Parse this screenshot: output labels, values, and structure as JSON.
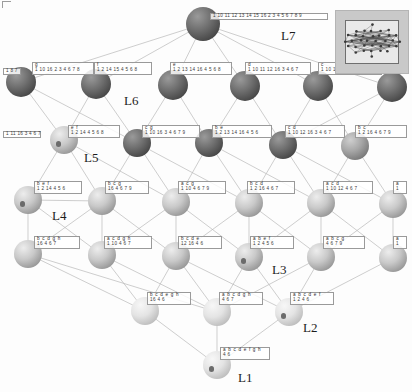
{
  "figure": {
    "kind": "concept-lattice-hasse-diagram",
    "levels": [
      "L1",
      "L2",
      "L3",
      "L4",
      "L5",
      "L6",
      "L7"
    ],
    "level_tags": [
      {
        "text": "L7",
        "x": 281,
        "y": 28
      },
      {
        "text": "L6",
        "x": 124,
        "y": 93
      },
      {
        "text": "L5",
        "x": 84,
        "y": 150
      },
      {
        "text": "L4",
        "x": 52,
        "y": 208
      },
      {
        "text": "L3",
        "x": 272,
        "y": 262
      },
      {
        "text": "L2",
        "x": 303,
        "y": 320
      },
      {
        "text": "L1",
        "x": 238,
        "y": 370
      }
    ]
  },
  "nodes": [
    {
      "id": "top",
      "level": "L7",
      "x": 203,
      "y": 24,
      "r": 17,
      "shade": "dark",
      "label": {
        "attrs": "",
        "objs": "1 10 11 12 13 14 15 16 2 3 4 5 6 7 8 9",
        "x": 210,
        "y": 13,
        "w": 118,
        "flat": true
      }
    },
    {
      "id": "l6-0",
      "level": "L6",
      "x": 21,
      "y": 82,
      "r": 15,
      "shade": "dark",
      "label": {
        "attrs": "g",
        "objs": "1 10 16 2 3 4 6 7 8",
        "x": 32,
        "y": 62,
        "w": 62,
        "flat": false
      }
    },
    {
      "id": "l6-0b",
      "level": "L6",
      "x": 21,
      "y": 82,
      "r": 0,
      "shade": "none",
      "label": {
        "attrs": "",
        "objs": "1 8 7",
        "x": 3,
        "y": 68,
        "w": 18,
        "flat": true
      }
    },
    {
      "id": "l6-1",
      "level": "L6",
      "x": 96,
      "y": 84,
      "r": 15,
      "shade": "dark",
      "label": {
        "attrs": "f",
        "objs": "1 2 14 15 4 5 6 8",
        "x": 94,
        "y": 62,
        "w": 58,
        "flat": false
      }
    },
    {
      "id": "l6-2",
      "level": "L6",
      "x": 173,
      "y": 85,
      "r": 15,
      "shade": "dark",
      "label": {
        "attrs": "e",
        "objs": "1 2 13 14 16 4 5 6 8",
        "x": 170,
        "y": 62,
        "w": 62,
        "flat": false
      }
    },
    {
      "id": "l6-3",
      "level": "L6",
      "x": 245,
      "y": 86,
      "r": 15,
      "shade": "dark",
      "label": {
        "attrs": "d",
        "objs": "1 10 11 12 16 3 4 6 7",
        "x": 245,
        "y": 62,
        "w": 66,
        "flat": false
      }
    },
    {
      "id": "l6-4",
      "level": "L6",
      "x": 318,
      "y": 86,
      "r": 15,
      "shade": "dark",
      "label": {
        "attrs": "c",
        "objs": "1 10 12 16 3 4 6 7 9",
        "x": 318,
        "y": 62,
        "w": 64,
        "flat": false
      }
    },
    {
      "id": "l6-5",
      "level": "L6",
      "x": 392,
      "y": 87,
      "r": 15,
      "shade": "dark",
      "label": {
        "attrs": "",
        "objs": "1",
        "x": 392,
        "y": 66,
        "w": 14,
        "flat": true
      }
    },
    {
      "id": "l5-0",
      "level": "L5",
      "x": 64,
      "y": 140,
      "r": 14,
      "shade": "light",
      "core": true,
      "label": {
        "attrs": "e f",
        "objs": "1 2 14 4 5 6 8",
        "x": 68,
        "y": 125,
        "w": 52,
        "flat": false
      }
    },
    {
      "id": "l5-0b",
      "level": "L5",
      "x": 0,
      "y": 0,
      "r": 0,
      "shade": "none",
      "label": {
        "attrs": "",
        "objs": "1 11 16 3 4 6 7",
        "x": 3,
        "y": 131,
        "w": 38,
        "flat": true
      }
    },
    {
      "id": "l5-1",
      "level": "L5",
      "x": 137,
      "y": 143,
      "r": 14,
      "shade": "dark",
      "label": {
        "attrs": "c g",
        "objs": "1 10 16 3 4 6 7 9",
        "x": 142,
        "y": 125,
        "w": 58,
        "flat": false
      }
    },
    {
      "id": "l5-2",
      "level": "L5",
      "x": 209,
      "y": 143,
      "r": 14,
      "shade": "dark",
      "label": {
        "attrs": "b e",
        "objs": "1 2 13 14 16 4 5 6",
        "x": 212,
        "y": 125,
        "w": 60,
        "flat": false
      }
    },
    {
      "id": "l5-3",
      "level": "L5",
      "x": 283,
      "y": 145,
      "r": 14,
      "shade": "dark",
      "label": {
        "attrs": "c d",
        "objs": "1 10 12 16 3 4 6 7",
        "x": 285,
        "y": 125,
        "w": 60,
        "flat": false
      }
    },
    {
      "id": "l5-4",
      "level": "L5",
      "x": 355,
      "y": 146,
      "r": 14,
      "shade": "mid",
      "label": {
        "attrs": "b c",
        "objs": "1 2 16 4 6 7 9",
        "x": 355,
        "y": 125,
        "w": 52,
        "flat": false
      }
    },
    {
      "id": "l4-0",
      "level": "L4",
      "x": 28,
      "y": 200,
      "r": 14,
      "shade": "light",
      "core": true,
      "label": {
        "attrs": "b e f",
        "objs": "1 2 14 4 5 6",
        "x": 34,
        "y": 181,
        "w": 48,
        "flat": false
      }
    },
    {
      "id": "l4-1",
      "level": "L4",
      "x": 102,
      "y": 201,
      "r": 14,
      "shade": "light",
      "label": {
        "attrs": "b c g",
        "objs": "16 4 6 7 9",
        "x": 105,
        "y": 181,
        "w": 44,
        "flat": false
      }
    },
    {
      "id": "l4-2",
      "level": "L4",
      "x": 176,
      "y": 202,
      "r": 14,
      "shade": "light",
      "label": {
        "attrs": "a c g",
        "objs": "1 10 4 6 7 9",
        "x": 178,
        "y": 181,
        "w": 48,
        "flat": false
      }
    },
    {
      "id": "l4-3",
      "level": "L4",
      "x": 249,
      "y": 203,
      "r": 14,
      "shade": "light",
      "label": {
        "attrs": "b c d",
        "objs": "1 2 16 4 6 7",
        "x": 247,
        "y": 181,
        "w": 48,
        "flat": false
      }
    },
    {
      "id": "l4-4",
      "level": "L4",
      "x": 321,
      "y": 203,
      "r": 14,
      "shade": "light",
      "label": {
        "attrs": "a c d",
        "objs": "1 10 12 4 6 7",
        "x": 323,
        "y": 181,
        "w": 50,
        "flat": false
      }
    },
    {
      "id": "l4-5",
      "level": "L4",
      "x": 393,
      "y": 204,
      "r": 14,
      "shade": "light",
      "label": {
        "attrs": "a",
        "objs": "1",
        "x": 393,
        "y": 181,
        "w": 14,
        "flat": false
      }
    },
    {
      "id": "l3-0",
      "level": "L3",
      "x": 28,
      "y": 254,
      "r": 14,
      "shade": "light",
      "label": {
        "attrs": "b c d g h",
        "objs": "16 4 6 7",
        "x": 34,
        "y": 236,
        "w": 46,
        "flat": false
      }
    },
    {
      "id": "l3-1",
      "level": "L3",
      "x": 102,
      "y": 255,
      "r": 14,
      "shade": "light",
      "label": {
        "attrs": "a c d g h",
        "objs": "1 10 4 6 7",
        "x": 104,
        "y": 236,
        "w": 48,
        "flat": false
      }
    },
    {
      "id": "l3-2",
      "level": "L3",
      "x": 176,
      "y": 256,
      "r": 14,
      "shade": "light",
      "label": {
        "attrs": "b c d e",
        "objs": "12 16 4 6",
        "x": 178,
        "y": 236,
        "w": 44,
        "flat": false
      }
    },
    {
      "id": "l3-3",
      "level": "L3",
      "x": 249,
      "y": 257,
      "r": 14,
      "shade": "light",
      "core": true,
      "label": {
        "attrs": "a b e f",
        "objs": "1 2 4 5 6",
        "x": 250,
        "y": 236,
        "w": 44,
        "flat": false
      }
    },
    {
      "id": "l3-4",
      "level": "L3",
      "x": 321,
      "y": 257,
      "r": 14,
      "shade": "light",
      "label": {
        "attrs": "a b c g",
        "objs": "4 6 7 9",
        "x": 323,
        "y": 236,
        "w": 42,
        "flat": false
      }
    },
    {
      "id": "l3-5",
      "level": "L3",
      "x": 393,
      "y": 258,
      "r": 14,
      "shade": "light",
      "label": {
        "attrs": "a",
        "objs": "1",
        "x": 393,
        "y": 236,
        "w": 14,
        "flat": false
      }
    },
    {
      "id": "l2-0",
      "level": "L2",
      "x": 145,
      "y": 311,
      "r": 14,
      "shade": "pale",
      "label": {
        "attrs": "b c d e g h",
        "objs": "16 4 6",
        "x": 147,
        "y": 292,
        "w": 44,
        "flat": false
      }
    },
    {
      "id": "l2-1",
      "level": "L2",
      "x": 217,
      "y": 312,
      "r": 14,
      "shade": "pale",
      "label": {
        "attrs": "a b c d g h",
        "objs": "4 6 7",
        "x": 219,
        "y": 292,
        "w": 44,
        "flat": false
      }
    },
    {
      "id": "l2-2",
      "level": "L2",
      "x": 289,
      "y": 312,
      "r": 14,
      "shade": "pale",
      "core": true,
      "label": {
        "attrs": "a b c d e f",
        "objs": "1 2 4 6",
        "x": 290,
        "y": 292,
        "w": 44,
        "flat": false
      }
    },
    {
      "id": "l1-0",
      "level": "L1",
      "x": 217,
      "y": 365,
      "r": 14,
      "shade": "pale",
      "core": true,
      "label": {
        "attrs": "a b c d e f g h",
        "objs": "4 6",
        "x": 220,
        "y": 347,
        "w": 50,
        "flat": false
      }
    }
  ],
  "edges": [
    [
      203,
      24,
      21,
      82
    ],
    [
      203,
      24,
      96,
      84
    ],
    [
      203,
      24,
      173,
      85
    ],
    [
      203,
      24,
      245,
      86
    ],
    [
      203,
      24,
      318,
      86
    ],
    [
      203,
      24,
      392,
      87
    ],
    [
      21,
      82,
      64,
      140
    ],
    [
      96,
      84,
      64,
      140
    ],
    [
      96,
      84,
      137,
      143
    ],
    [
      173,
      85,
      209,
      143
    ],
    [
      245,
      86,
      283,
      145
    ],
    [
      318,
      86,
      283,
      145
    ],
    [
      318,
      86,
      355,
      146
    ],
    [
      392,
      87,
      355,
      146
    ],
    [
      21,
      82,
      137,
      143
    ],
    [
      173,
      85,
      137,
      143
    ],
    [
      245,
      86,
      209,
      143
    ],
    [
      392,
      87,
      283,
      145
    ],
    [
      64,
      140,
      28,
      200
    ],
    [
      64,
      140,
      102,
      201
    ],
    [
      137,
      143,
      102,
      201
    ],
    [
      137,
      143,
      176,
      202
    ],
    [
      209,
      143,
      176,
      202
    ],
    [
      209,
      143,
      249,
      203
    ],
    [
      283,
      145,
      249,
      203
    ],
    [
      283,
      145,
      321,
      203
    ],
    [
      355,
      146,
      321,
      203
    ],
    [
      355,
      146,
      393,
      204
    ],
    [
      64,
      140,
      176,
      202
    ],
    [
      137,
      143,
      249,
      203
    ],
    [
      209,
      143,
      321,
      203
    ],
    [
      283,
      145,
      393,
      204
    ],
    [
      28,
      200,
      102,
      201
    ],
    [
      28,
      200,
      28,
      254
    ],
    [
      102,
      201,
      102,
      255
    ],
    [
      176,
      202,
      176,
      256
    ],
    [
      249,
      203,
      249,
      257
    ],
    [
      321,
      203,
      321,
      257
    ],
    [
      393,
      204,
      393,
      258
    ],
    [
      28,
      200,
      102,
      255
    ],
    [
      102,
      201,
      176,
      256
    ],
    [
      176,
      202,
      249,
      257
    ],
    [
      249,
      203,
      321,
      257
    ],
    [
      321,
      203,
      393,
      258
    ],
    [
      102,
      201,
      28,
      254
    ],
    [
      176,
      202,
      102,
      255
    ],
    [
      249,
      203,
      176,
      256
    ],
    [
      321,
      203,
      249,
      257
    ],
    [
      393,
      204,
      321,
      257
    ],
    [
      28,
      254,
      145,
      311
    ],
    [
      102,
      255,
      145,
      311
    ],
    [
      176,
      256,
      145,
      311
    ],
    [
      176,
      256,
      217,
      312
    ],
    [
      249,
      257,
      217,
      312
    ],
    [
      321,
      257,
      217,
      312
    ],
    [
      249,
      257,
      289,
      312
    ],
    [
      321,
      257,
      289,
      312
    ],
    [
      393,
      258,
      289,
      312
    ],
    [
      102,
      255,
      217,
      312
    ],
    [
      28,
      254,
      217,
      312
    ],
    [
      176,
      256,
      289,
      312
    ],
    [
      145,
      311,
      217,
      365
    ],
    [
      217,
      312,
      217,
      365
    ],
    [
      289,
      312,
      217,
      365
    ]
  ],
  "inset": {
    "name": "network-thumbnail",
    "x": 335,
    "y": 10,
    "w": 72,
    "h": 62
  }
}
